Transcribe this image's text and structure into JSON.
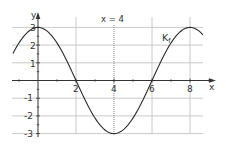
{
  "chart_data": {
    "type": "line",
    "title": "",
    "xlabel": "x",
    "ylabel": "y",
    "xlim": [
      -1.35,
      9.2
    ],
    "ylim": [
      -3,
      3.6
    ],
    "grid": true,
    "x_ticks": [
      2,
      4,
      6,
      8
    ],
    "x_tick_labels": [
      "2",
      "4",
      "6",
      "8"
    ],
    "y_ticks": [
      -3,
      -2,
      -1,
      1,
      2,
      3
    ],
    "y_tick_labels": [
      "-3",
      "-2",
      "-1",
      "1",
      "2",
      "3"
    ],
    "series": [
      {
        "name": "Kf",
        "function": "3*cos(pi*x/4)",
        "x": [
          -1.3,
          -1,
          0,
          1,
          2,
          3,
          4,
          5,
          6,
          7,
          8,
          8.7
        ],
        "values": [
          1.57,
          2.12,
          3,
          2.12,
          0,
          -2.12,
          -3,
          -2.12,
          0,
          2.12,
          3,
          2.67
        ]
      }
    ],
    "annotations": [
      {
        "text": "x = 4",
        "type": "vertical-dotted-line",
        "x": 4
      },
      {
        "text": "K",
        "subscript": "f",
        "type": "curve-label",
        "x": 6.7,
        "y": 2.4
      }
    ]
  },
  "labels": {
    "x_axis": "x",
    "y_axis": "y",
    "vline": "x = 4",
    "curve_main": "K",
    "curve_sub": "f",
    "xt": [
      "2",
      "4",
      "6",
      "8"
    ],
    "yt": [
      "3",
      "2",
      "1",
      "-1",
      "-2",
      "-3"
    ]
  },
  "colors": {
    "curve": "#2b2b2b",
    "axis": "#333333",
    "grid": "#c4c4c4",
    "text": "#333333"
  }
}
